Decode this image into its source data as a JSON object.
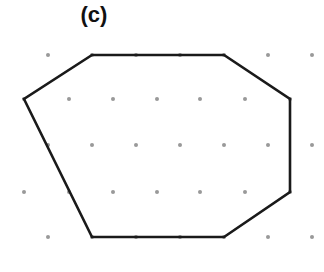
{
  "figure": {
    "label": "(c)",
    "dot_color": "#999999",
    "line_color": "#1a1a1a",
    "dot_rows": [
      {
        "y": 55,
        "xs": [
          48,
          92,
          136,
          180,
          224,
          268,
          312
        ]
      },
      {
        "y": 99,
        "xs": [
          24,
          69,
          113,
          157,
          200,
          245,
          290
        ]
      },
      {
        "y": 145,
        "xs": [
          48,
          92,
          136,
          180,
          224,
          268,
          312
        ]
      },
      {
        "y": 192,
        "xs": [
          24,
          69,
          113,
          157,
          200,
          245,
          290
        ]
      },
      {
        "y": 237,
        "xs": [
          48,
          92,
          136,
          180,
          224,
          268,
          312
        ]
      }
    ],
    "polygon": [
      [
        92,
        55
      ],
      [
        224,
        55
      ],
      [
        290,
        99
      ],
      [
        290,
        192
      ],
      [
        224,
        237
      ],
      [
        92,
        237
      ],
      [
        24,
        99
      ]
    ]
  }
}
